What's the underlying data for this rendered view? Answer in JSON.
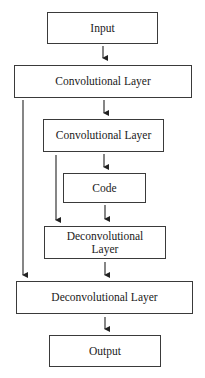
{
  "diagram": {
    "type": "flowchart",
    "nodes": [
      {
        "id": "input",
        "label": "Input"
      },
      {
        "id": "conv1",
        "label": "Convolutional Layer"
      },
      {
        "id": "conv2",
        "label": "Convolutional Layer"
      },
      {
        "id": "code",
        "label": "Code"
      },
      {
        "id": "deconv1",
        "label": "Deconvolutional Layer"
      },
      {
        "id": "deconv2",
        "label": "Deconvolutional Layer"
      },
      {
        "id": "output",
        "label": "Output"
      }
    ],
    "edges": [
      {
        "from": "input",
        "to": "conv1"
      },
      {
        "from": "conv1",
        "to": "conv2"
      },
      {
        "from": "conv2",
        "to": "code"
      },
      {
        "from": "code",
        "to": "deconv1"
      },
      {
        "from": "deconv1",
        "to": "deconv2"
      },
      {
        "from": "deconv2",
        "to": "output"
      },
      {
        "from": "conv1",
        "to": "deconv2",
        "kind": "skip"
      },
      {
        "from": "conv2",
        "to": "deconv1",
        "kind": "skip"
      }
    ],
    "colors": {
      "stroke": "#3a3a3a",
      "background": "#ffffff"
    }
  }
}
